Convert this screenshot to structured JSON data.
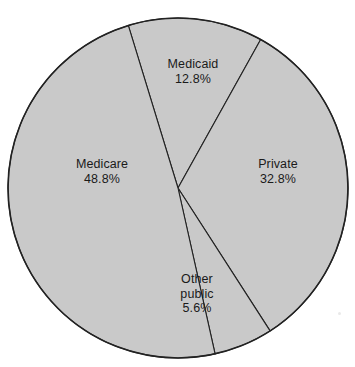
{
  "chart_data": {
    "type": "pie",
    "title": "",
    "categories": [
      "Medicaid",
      "Private",
      "Other public",
      "Medicare"
    ],
    "values": [
      12.8,
      32.8,
      5.6,
      48.8
    ],
    "unit": "%",
    "legend": "none",
    "grid": false,
    "slices": [
      {
        "name": "Medicaid",
        "value": 12.8,
        "value_label": "12.8%",
        "start_angle_deg": 343.0,
        "end_angle_deg": 29.1,
        "fill": "#c9c9c9",
        "stroke": "#222222"
      },
      {
        "name": "Private",
        "value": 32.8,
        "value_label": "32.8%",
        "start_angle_deg": 29.1,
        "end_angle_deg": 147.2,
        "fill": "#c9c9c9",
        "stroke": "#222222"
      },
      {
        "name": "Other public",
        "value": 5.6,
        "value_label": "5.6%",
        "start_angle_deg": 147.2,
        "end_angle_deg": 167.4,
        "fill": "#c9c9c9",
        "stroke": "#222222"
      },
      {
        "name": "Medicare",
        "value": 48.8,
        "value_label": "48.8%",
        "start_angle_deg": 167.4,
        "end_angle_deg": 343.0,
        "fill": "#c9c9c9",
        "stroke": "#222222"
      }
    ],
    "labels": {
      "medicaid": {
        "name": "Medicaid",
        "value_label": "12.8%"
      },
      "medicare": {
        "name": "Medicare",
        "value_label": "48.8%"
      },
      "private": {
        "name": "Private",
        "value_label": "32.8%"
      },
      "other_public": {
        "name": "Other",
        "name_line2": "public",
        "value_label": "5.6%"
      }
    },
    "geometry": {
      "center_x": 178,
      "center_y": 188,
      "radius": 170
    },
    "colors": {
      "slice_fill": "#c9c9c9",
      "outline": "#222222",
      "background": "#ffffff",
      "text": "#1a1a1a"
    }
  }
}
